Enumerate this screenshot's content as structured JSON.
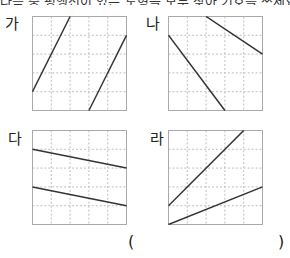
{
  "question": {
    "cut_text": "다음 중 평행선이 있는 도형을 모두 찾아 기호를 쓰세요."
  },
  "grid": {
    "cols": 5,
    "rows": 5,
    "grid_color": "#bdbdbd",
    "border_color": "#aaaaaa",
    "line_color": "#333333"
  },
  "panels": [
    {
      "label": "가",
      "lines": [
        [
          0,
          4,
          2,
          0
        ],
        [
          3,
          5,
          5,
          1
        ]
      ]
    },
    {
      "label": "나",
      "lines": [
        [
          0,
          1,
          3,
          5
        ],
        [
          2,
          0,
          5,
          2
        ]
      ]
    },
    {
      "label": "다",
      "lines": [
        [
          0,
          1,
          5,
          2
        ],
        [
          0,
          3,
          5,
          4
        ]
      ]
    },
    {
      "label": "라",
      "lines": [
        [
          0,
          4,
          4,
          0
        ],
        [
          0,
          5,
          5,
          3
        ]
      ]
    }
  ],
  "answer": {
    "open": "(",
    "close": ")",
    "value": ""
  }
}
